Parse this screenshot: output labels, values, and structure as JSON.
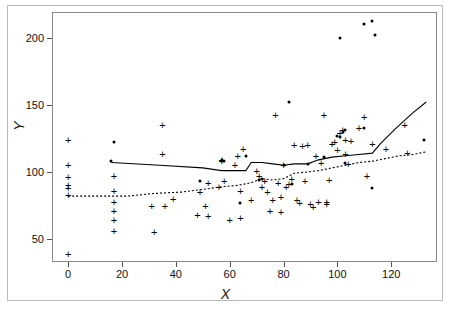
{
  "chart_data": {
    "type": "scatter",
    "title": "",
    "xlabel": "X",
    "ylabel": "Y",
    "xlim": [
      -6,
      137
    ],
    "ylim": [
      33,
      219
    ],
    "xticks": [
      0,
      20,
      40,
      60,
      80,
      100,
      120
    ],
    "yticks": [
      50,
      100,
      150,
      200
    ],
    "grid": false,
    "legend": "none",
    "series": [
      {
        "name": "plus-markers",
        "marker": "+",
        "color": "#000000",
        "points": [
          [
            0,
            124
          ],
          [
            0,
            105
          ],
          [
            0,
            96
          ],
          [
            0,
            90
          ],
          [
            0,
            88
          ],
          [
            0,
            83
          ],
          [
            0,
            39
          ],
          [
            17,
            97
          ],
          [
            17,
            86
          ],
          [
            17,
            78
          ],
          [
            17,
            71
          ],
          [
            17,
            64
          ],
          [
            17,
            56
          ],
          [
            31,
            75
          ],
          [
            32,
            55
          ],
          [
            35,
            113
          ],
          [
            35,
            135
          ],
          [
            36,
            75
          ],
          [
            39,
            80
          ],
          [
            48,
            68
          ],
          [
            49,
            85
          ],
          [
            51,
            75
          ],
          [
            52,
            67
          ],
          [
            52,
            92
          ],
          [
            56,
            89
          ],
          [
            57,
            108
          ],
          [
            57,
            109
          ],
          [
            58,
            93
          ],
          [
            60,
            64
          ],
          [
            62,
            105
          ],
          [
            63,
            112
          ],
          [
            64,
            86
          ],
          [
            64,
            66
          ],
          [
            65,
            117
          ],
          [
            68,
            79
          ],
          [
            70,
            101
          ],
          [
            71,
            97
          ],
          [
            72,
            89
          ],
          [
            73,
            93
          ],
          [
            74,
            85
          ],
          [
            75,
            71
          ],
          [
            76,
            79
          ],
          [
            77,
            142
          ],
          [
            78,
            92
          ],
          [
            79,
            70
          ],
          [
            79,
            81
          ],
          [
            80,
            105
          ],
          [
            81,
            89
          ],
          [
            82,
            91
          ],
          [
            83,
            95
          ],
          [
            84,
            120
          ],
          [
            85,
            79
          ],
          [
            86,
            77
          ],
          [
            87,
            119
          ],
          [
            88,
            93
          ],
          [
            89,
            120
          ],
          [
            90,
            76
          ],
          [
            91,
            74
          ],
          [
            92,
            112
          ],
          [
            93,
            78
          ],
          [
            94,
            107
          ],
          [
            95,
            142
          ],
          [
            96,
            78
          ],
          [
            96,
            76
          ],
          [
            97,
            94
          ],
          [
            98,
            121
          ],
          [
            99,
            122
          ],
          [
            100,
            116
          ],
          [
            101,
            129
          ],
          [
            102,
            131
          ],
          [
            103,
            113
          ],
          [
            103,
            124
          ],
          [
            104,
            106
          ],
          [
            105,
            123
          ],
          [
            108,
            133
          ],
          [
            110,
            141
          ],
          [
            111,
            97
          ],
          [
            113,
            121
          ],
          [
            118,
            117
          ],
          [
            125,
            135
          ],
          [
            126,
            114
          ]
        ]
      },
      {
        "name": "dot-markers",
        "marker": "dot",
        "color": "#000000",
        "points": [
          [
            17,
            122
          ],
          [
            16,
            108
          ],
          [
            49,
            93
          ],
          [
            57,
            109
          ],
          [
            58,
            108
          ],
          [
            64,
            77
          ],
          [
            66,
            112
          ],
          [
            71,
            94
          ],
          [
            72,
            95
          ],
          [
            80,
            105
          ],
          [
            82,
            152
          ],
          [
            83,
            91
          ],
          [
            89,
            106
          ],
          [
            95,
            111
          ],
          [
            100,
            127
          ],
          [
            101,
            200
          ],
          [
            101,
            126
          ],
          [
            102,
            130
          ],
          [
            103,
            131
          ],
          [
            103,
            107
          ],
          [
            110,
            210
          ],
          [
            110,
            133
          ],
          [
            113,
            212
          ],
          [
            113,
            88
          ],
          [
            114,
            202
          ],
          [
            132,
            124
          ]
        ]
      }
    ],
    "lines": [
      {
        "name": "solid-smoother",
        "style": "solid",
        "color": "#000000",
        "points": [
          [
            16,
            107
          ],
          [
            34,
            105
          ],
          [
            50,
            103
          ],
          [
            57,
            101
          ],
          [
            64,
            101
          ],
          [
            66,
            101
          ],
          [
            68,
            107
          ],
          [
            72,
            107
          ],
          [
            76,
            106
          ],
          [
            80,
            105
          ],
          [
            84,
            106
          ],
          [
            89,
            106
          ],
          [
            93,
            109
          ],
          [
            98,
            111
          ],
          [
            103,
            112
          ],
          [
            108,
            113
          ],
          [
            113,
            114
          ],
          [
            116,
            121
          ],
          [
            122,
            133
          ],
          [
            128,
            144
          ],
          [
            133,
            152
          ]
        ]
      },
      {
        "name": "dotted-smoother",
        "style": "dotted",
        "color": "#000000",
        "points": [
          [
            0,
            82
          ],
          [
            12,
            82
          ],
          [
            22,
            82
          ],
          [
            32,
            84
          ],
          [
            42,
            85
          ],
          [
            50,
            87
          ],
          [
            57,
            89
          ],
          [
            63,
            90
          ],
          [
            68,
            92
          ],
          [
            72,
            95
          ],
          [
            76,
            94
          ],
          [
            80,
            95
          ],
          [
            84,
            99
          ],
          [
            89,
            100
          ],
          [
            93,
            101
          ],
          [
            98,
            103
          ],
          [
            103,
            105
          ],
          [
            108,
            107
          ],
          [
            113,
            108
          ],
          [
            118,
            110
          ],
          [
            123,
            112
          ],
          [
            128,
            113
          ],
          [
            133,
            115
          ]
        ]
      }
    ]
  },
  "axes": {
    "y_tick_labels": [
      "50",
      "100",
      "150",
      "200"
    ],
    "x_tick_labels": [
      "0",
      "20",
      "40",
      "60",
      "80",
      "100",
      "120"
    ],
    "x_axis_title": "X",
    "y_axis_title": "Y"
  }
}
